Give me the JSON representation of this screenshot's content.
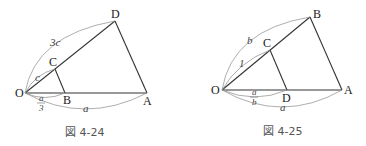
{
  "figures": [
    {
      "caption": "図 4-24",
      "points": {
        "O": "O",
        "A": "A",
        "B": "B",
        "C": "C",
        "D": "D"
      },
      "labels": {
        "OD": "3c",
        "OC": "c",
        "OB_num": "a",
        "OB_den": "3",
        "OA": "a"
      }
    },
    {
      "caption": "図 4-25",
      "points": {
        "O": "O",
        "A": "A",
        "B": "B",
        "C": "C",
        "D": "D"
      },
      "labels": {
        "OB": "b",
        "OC": "1",
        "OD_num": "a",
        "OD_den": "b",
        "OA": "a"
      }
    }
  ]
}
